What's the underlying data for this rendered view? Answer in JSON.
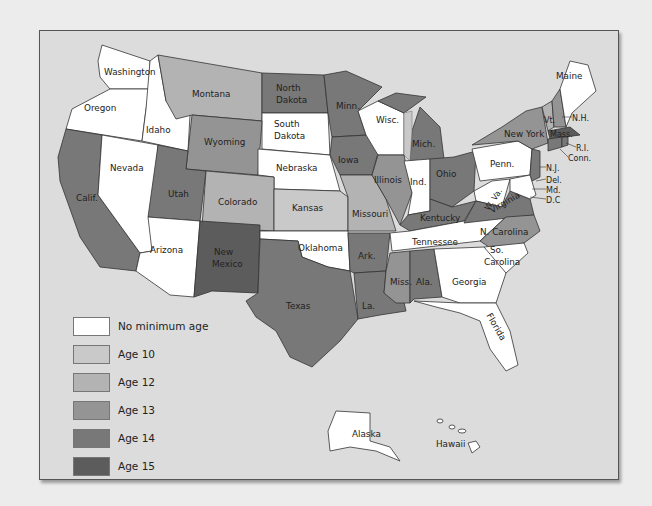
{
  "colors": {
    "none": "#ffffff",
    "age10": "#c9c9c9",
    "age12": "#b3b3b3",
    "age13": "#949494",
    "age14": "#787878",
    "age15": "#5c5c5c",
    "water": "#dcdcdc"
  },
  "legend": {
    "items": [
      {
        "key": "none",
        "label": "No minimum age",
        "color": "#ffffff"
      },
      {
        "key": "age10",
        "label": "Age 10",
        "color": "#c9c9c9"
      },
      {
        "key": "age12",
        "label": "Age 12",
        "color": "#b3b3b3"
      },
      {
        "key": "age13",
        "label": "Age 13",
        "color": "#949494"
      },
      {
        "key": "age14",
        "label": "Age 14",
        "color": "#787878"
      },
      {
        "key": "age15",
        "label": "Age 15",
        "color": "#5c5c5c"
      }
    ]
  },
  "states": {
    "washington": {
      "label": "Washington",
      "category": "No minimum age"
    },
    "oregon": {
      "label": "Oregon",
      "category": "No minimum age"
    },
    "idaho": {
      "label": "Idaho",
      "category": "No minimum age"
    },
    "montana": {
      "label": "Montana",
      "category": "Age 12"
    },
    "north_dakota": {
      "label1": "North",
      "label2": "Dakota",
      "category": "Age 14"
    },
    "south_dakota": {
      "label1": "South",
      "label2": "Dakota",
      "category": "No minimum age"
    },
    "minnesota": {
      "label": "Minn.",
      "category": "Age 14"
    },
    "wisconsin": {
      "label": "Wisc.",
      "category": "No minimum age"
    },
    "michigan": {
      "label": "Mich.",
      "category": "Age 14"
    },
    "california": {
      "label": "Calif.",
      "category": "Age 14"
    },
    "nevada": {
      "label": "Nevada",
      "category": "No minimum age"
    },
    "utah": {
      "label": "Utah",
      "category": "Age 14"
    },
    "wyoming": {
      "label": "Wyoming",
      "category": "Age 13"
    },
    "colorado": {
      "label": "Colorado",
      "category": "Age 12"
    },
    "nebraska": {
      "label": "Nebraska",
      "category": "No minimum age"
    },
    "kansas": {
      "label": "Kansas",
      "category": "Age 10"
    },
    "iowa": {
      "label": "Iowa",
      "category": "Age 14"
    },
    "illinois": {
      "label": "Illinois",
      "category": "Age 13"
    },
    "indiana": {
      "label": "Ind.",
      "category": "No minimum age"
    },
    "ohio": {
      "label": "Ohio",
      "category": "Age 14"
    },
    "missouri": {
      "label": "Missouri",
      "category": "Age 12"
    },
    "arizona": {
      "label": "Arizona",
      "category": "No minimum age"
    },
    "new_mexico": {
      "label1": "New",
      "label2": "Mexico",
      "category": "Age 15"
    },
    "oklahoma": {
      "label": "Oklahoma",
      "category": "No minimum age"
    },
    "texas": {
      "label": "Texas",
      "category": "Age 14"
    },
    "arkansas": {
      "label": "Ark.",
      "category": "Age 14"
    },
    "louisiana": {
      "label": "La.",
      "category": "Age 14"
    },
    "mississippi": {
      "label": "Miss.",
      "category": "Age 13"
    },
    "alabama": {
      "label": "Ala.",
      "category": "Age 14"
    },
    "georgia": {
      "label": "Georgia",
      "category": "No minimum age"
    },
    "florida": {
      "label": "Florida",
      "category": "No minimum age"
    },
    "tennessee": {
      "label": "Tennessee",
      "category": "No minimum age"
    },
    "kentucky": {
      "label": "Kentucky",
      "category": "Age 14"
    },
    "north_carolina": {
      "label": "N. Carolina",
      "category": "Age 13"
    },
    "south_carolina": {
      "label1": "So.",
      "label2": "Carolina",
      "category": "No minimum age"
    },
    "virginia": {
      "label": "Virginia",
      "category": "Age 14"
    },
    "west_virginia": {
      "label": "W. Va.",
      "category": "No minimum age"
    },
    "pennsylvania": {
      "label": "Penn.",
      "category": "No minimum age"
    },
    "new_york": {
      "label": "New York",
      "category": "Age 13"
    },
    "vermont": {
      "label": "Vt.",
      "category": "Age 12"
    },
    "new_hampshire": {
      "label": "N.H.",
      "category": "Age 13"
    },
    "maine": {
      "label": "Maine",
      "category": "No minimum age"
    },
    "massachusetts": {
      "label": "Mass.",
      "category": "Age 15"
    },
    "rhode_island": {
      "label": "R.I.",
      "category": "Age 14"
    },
    "connecticut": {
      "label": "Conn.",
      "category": "Age 14"
    },
    "new_jersey": {
      "label": "N.J.",
      "category": "Age 14"
    },
    "delaware": {
      "label": "Del.",
      "category": "No minimum age"
    },
    "maryland": {
      "label": "Md.",
      "category": "No minimum age"
    },
    "dc": {
      "label": "D.C",
      "category": "No minimum age"
    },
    "alaska": {
      "label": "Alaska",
      "category": "No minimum age"
    },
    "hawaii": {
      "label": "Hawaii",
      "category": "No minimum age"
    }
  }
}
